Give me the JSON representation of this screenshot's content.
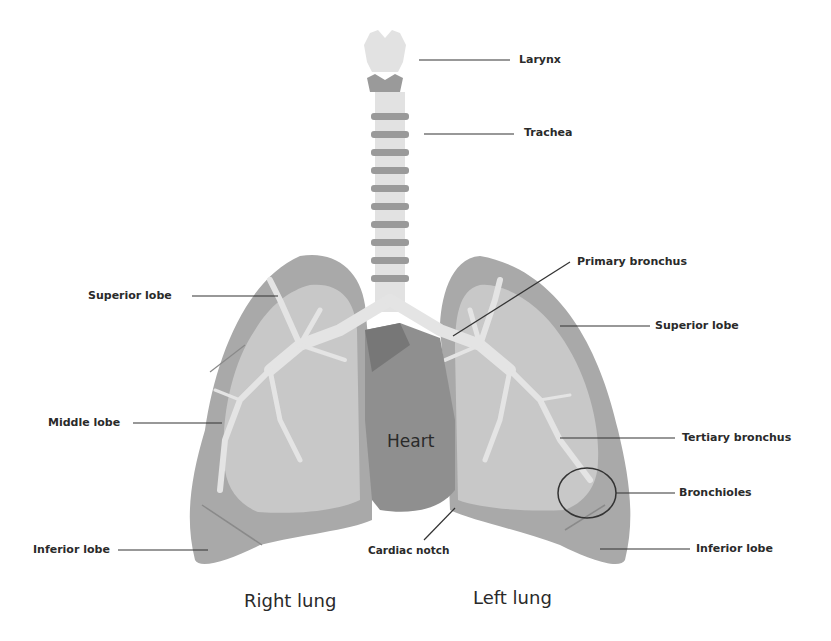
{
  "diagram": {
    "labels": {
      "larynx": "Larynx",
      "trachea": "Trachea",
      "primary_bronchus": "Primary bronchus",
      "right_superior_lobe": "Superior lobe",
      "left_superior_lobe": "Superior lobe",
      "middle_lobe": "Middle lobe",
      "tertiary_bronchus": "Tertiary bronchus",
      "bronchioles": "Bronchioles",
      "right_inferior_lobe": "Inferior lobe",
      "left_inferior_lobe": "Inferior lobe",
      "cardiac_notch": "Cardiac notch",
      "heart": "Heart",
      "right_lung": "Right lung",
      "left_lung": "Left lung"
    },
    "colors": {
      "lobe_outer": "#a9a9a9",
      "lobe_inner": "#c8c8c8",
      "bronchi": "#e4e4e4",
      "heart": "#8f8f8f",
      "heart_dark": "#777777",
      "trachea_light": "#e2e2e2",
      "trachea_ring": "#9a9a9a",
      "leader_line": "#333333"
    }
  }
}
